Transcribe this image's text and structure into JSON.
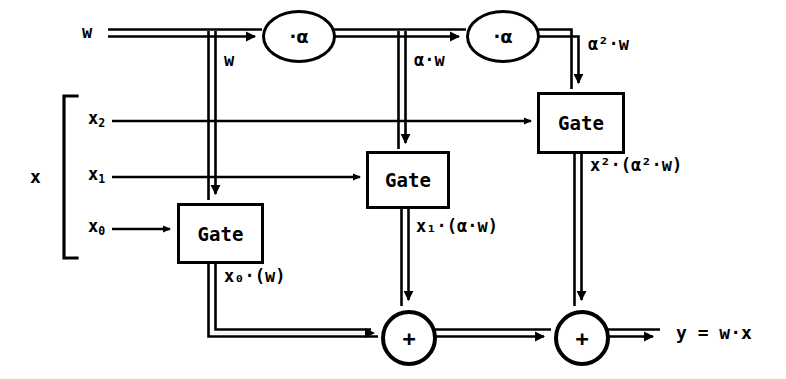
{
  "diagram": {
    "stroke_color": "#000000",
    "background_color": "#ffffff",
    "inputs": {
      "weight_label": "w",
      "vector_label": "x",
      "vector_elements": [
        "x2",
        "x1",
        "x0"
      ]
    },
    "multiplier_nodes": [
      {
        "id": "mul1",
        "label": "·α"
      },
      {
        "id": "mul2",
        "label": "·α"
      }
    ],
    "gates": [
      {
        "id": "gate0",
        "label": "Gate"
      },
      {
        "id": "gate1",
        "label": "Gate"
      },
      {
        "id": "gate2",
        "label": "Gate"
      }
    ],
    "adders": [
      {
        "id": "add1",
        "label": "+"
      },
      {
        "id": "add2",
        "label": "+"
      }
    ],
    "bus_labels": {
      "w_branch": "w",
      "alpha_w": "α·w",
      "alpha2_w": "α²·w"
    },
    "gate_outputs": {
      "gate0_out": "x₀·(w)",
      "gate1_out": "x₁·(α·w)",
      "gate2_out": "x²·(α²·w)"
    },
    "output": {
      "result": "y = w·x"
    }
  }
}
